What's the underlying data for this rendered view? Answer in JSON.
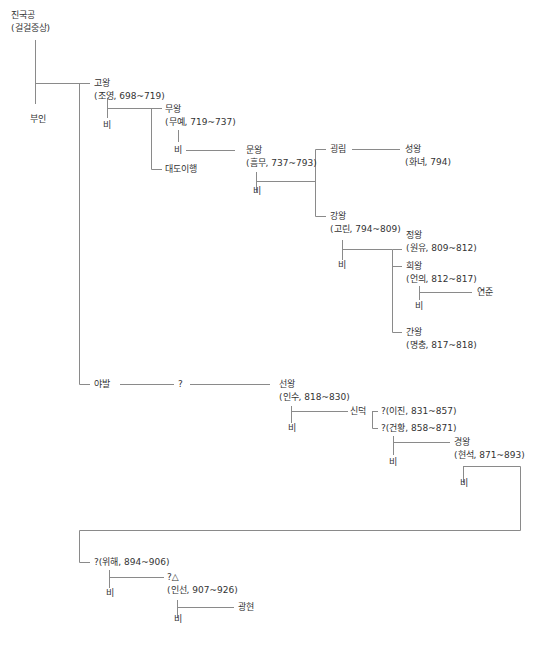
{
  "diagram": {
    "type": "family-tree",
    "nodes": {
      "jingukgong": {
        "name": "진국공",
        "detail": "(걸걸중상)"
      },
      "buin": {
        "name": "부인"
      },
      "gowang": {
        "name": "고왕",
        "detail": "(조영, 698~719)"
      },
      "gowang_bi": {
        "name": "비"
      },
      "muwang": {
        "name": "무왕",
        "detail": "(무예, 719~737)"
      },
      "muwang_bi": {
        "name": "비"
      },
      "daedoihaeng": {
        "name": "대도이행"
      },
      "munwang": {
        "name": "문왕",
        "detail": "(흠무, 737~793)"
      },
      "munwang_bi": {
        "name": "비"
      },
      "goengrim": {
        "name": "굉림"
      },
      "seongwang": {
        "name": "성왕",
        "detail": "(화녀, 794)"
      },
      "gangwang": {
        "name": "강왕",
        "detail": "(고린, 794~809)"
      },
      "gangwang_bi": {
        "name": "비"
      },
      "jeongwang": {
        "name": "정왕",
        "detail": "(원유, 809~812)"
      },
      "huiwang": {
        "name": "희왕",
        "detail": "(언의, 812~817)"
      },
      "huiwang_bi": {
        "name": "비"
      },
      "yeonjun": {
        "name": "연준"
      },
      "ganwang": {
        "name": "간왕",
        "detail": "(명충, 817~818)"
      },
      "yabal": {
        "name": "야발"
      },
      "unknown1": {
        "name": "?"
      },
      "seonwang": {
        "name": "선왕",
        "detail": "(인수, 818~830)"
      },
      "seonwang_bi": {
        "name": "비"
      },
      "sindeok": {
        "name": "신덕"
      },
      "ijin": {
        "name": "?(이진, 831~857)"
      },
      "geonhwang": {
        "name": "?(건황, 858~871)"
      },
      "geonhwang_bi": {
        "name": "비"
      },
      "gyeongwang": {
        "name": "경왕",
        "detail": "(현석, 871~893)"
      },
      "gyeongwang_bi": {
        "name": "비"
      },
      "wihae": {
        "name": "?(위해, 894~906)"
      },
      "wihae_bi": {
        "name": "비"
      },
      "inseon": {
        "name": "?△",
        "detail": "(인선, 907~926)"
      },
      "inseon_bi": {
        "name": "비"
      },
      "gwanghyeon": {
        "name": "광현"
      }
    }
  }
}
